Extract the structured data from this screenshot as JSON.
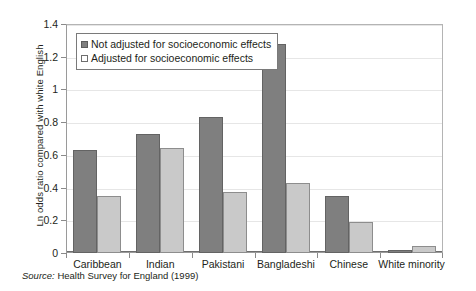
{
  "chart_data": {
    "type": "bar",
    "title": "",
    "xlabel": "",
    "ylabel": "Ln odds ratio compared with white English",
    "ylim": [
      0,
      1.4
    ],
    "ytick_labels": [
      "0",
      "0.2",
      "0.4",
      "0.6",
      "0.8",
      "1",
      "1.2",
      "1.4"
    ],
    "ytick_values": [
      0,
      0.2,
      0.4,
      0.6,
      0.8,
      1,
      1.2,
      1.4
    ],
    "grid": true,
    "legend_position": "top-left",
    "categories": [
      "Caribbean",
      "Indian",
      "Pakistani",
      "Bangladeshi",
      "Chinese",
      "White minority"
    ],
    "series": [
      {
        "name": "Not adjusted for socioeconomic effects",
        "color": "#7f7f7f",
        "values": [
          0.63,
          0.73,
          0.83,
          1.28,
          0.35,
          0.02
        ]
      },
      {
        "name": "Adjusted for socioeconomic effects",
        "color": "#c9c9c9",
        "values": [
          0.35,
          0.645,
          0.375,
          0.425,
          0.19,
          0.04
        ]
      }
    ]
  },
  "source": {
    "label": "Source:",
    "text": " Health Survey for England (1999)"
  }
}
